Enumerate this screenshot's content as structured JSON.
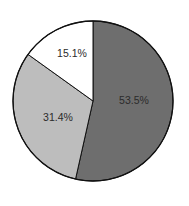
{
  "chart_data": {
    "type": "pie",
    "title": "",
    "start_angle_deg": 90,
    "direction": "clockwise",
    "slices": [
      {
        "label": "53.5%",
        "value": 53.5,
        "color": "#6e6e6e"
      },
      {
        "label": "31.4%",
        "value": 31.4,
        "color": "#bdbdbd"
      },
      {
        "label": "15.1%",
        "value": 15.1,
        "color": "#ffffff"
      }
    ],
    "legend": null
  }
}
